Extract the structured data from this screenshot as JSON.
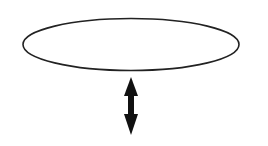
{
  "diagram": {
    "background": "#ffffff",
    "shapes": [
      {
        "type": "ellipse",
        "name": "plane-ellipse",
        "cx": 131,
        "cy": 44.5,
        "rx": 108,
        "ry": 26,
        "stroke": "#222222",
        "fill": "none"
      },
      {
        "type": "double-arrow",
        "name": "vertical-double-arrow",
        "x": 131,
        "y1": 77,
        "y2": 135,
        "color": "#111111"
      }
    ]
  }
}
